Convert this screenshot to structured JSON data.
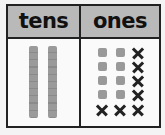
{
  "place_value_chart": {
    "headers": {
      "tens": "tens",
      "ones": "ones"
    },
    "tens": {
      "rods": 2
    },
    "ones": {
      "cubes_total": 13,
      "crossed_out": 7,
      "remaining": 6,
      "grid": [
        [
          "cube",
          "cube",
          "x"
        ],
        [
          "cube",
          "cube",
          "x"
        ],
        [
          "cube",
          "cube",
          "x"
        ],
        [
          "cube",
          "cube",
          "x"
        ],
        [
          "x",
          "x",
          "x"
        ]
      ]
    },
    "colors": {
      "header_bg": "#b9b9b9",
      "block_gray": "#999999",
      "border": "#222222",
      "x_mark": "#222222"
    }
  }
}
